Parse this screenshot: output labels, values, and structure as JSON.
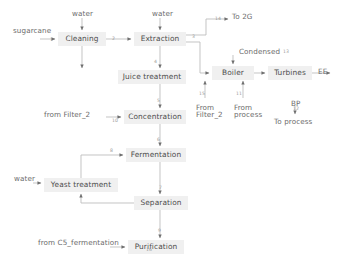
{
  "diagram": {
    "colors": {
      "node_fill": "#f0f0f0",
      "node_text": "#4d4d4d",
      "line": "#b9b9b9",
      "arrow": "#6e6e6e",
      "edge_label": "#9a9a9a",
      "plain_text": "#6b6b6b"
    },
    "nodes": [
      {
        "id": "cleaning",
        "label": "Cleaning",
        "x": 58,
        "y": 32,
        "w": 48,
        "h": 14
      },
      {
        "id": "extraction",
        "label": "Extraction",
        "x": 134,
        "y": 32,
        "w": 52,
        "h": 14
      },
      {
        "id": "juice_treatment",
        "label": "Juice treatment",
        "x": 118,
        "y": 70,
        "w": 68,
        "h": 14
      },
      {
        "id": "concentration",
        "label": "Concentration",
        "x": 124,
        "y": 110,
        "w": 62,
        "h": 14
      },
      {
        "id": "fermentation",
        "label": "Fermentation",
        "x": 126,
        "y": 148,
        "w": 60,
        "h": 14
      },
      {
        "id": "yeast_treatment",
        "label": "Yeast treatment",
        "x": 44,
        "y": 178,
        "w": 74,
        "h": 14
      },
      {
        "id": "separation",
        "label": "Separation",
        "x": 134,
        "y": 196,
        "w": 54,
        "h": 14
      },
      {
        "id": "purification",
        "label": "Purification",
        "x": 128,
        "y": 240,
        "w": 56,
        "h": 14
      },
      {
        "id": "boiler",
        "label": "Boiler",
        "x": 212,
        "y": 66,
        "w": 42,
        "h": 14
      },
      {
        "id": "turbines",
        "label": "Turbines",
        "x": 268,
        "y": 66,
        "w": 44,
        "h": 14
      }
    ],
    "terminals": [
      {
        "id": "sugarcane",
        "label": "sugarcane",
        "x": 13,
        "y": 27
      },
      {
        "id": "water_cleaning",
        "label": "water",
        "x": 72,
        "y": 10
      },
      {
        "id": "water_extraction",
        "label": "water",
        "x": 152,
        "y": 10
      },
      {
        "id": "to_2g",
        "label": "To 2G",
        "x": 232,
        "y": 13
      },
      {
        "id": "condensed",
        "label": "Condensed",
        "x": 239,
        "y": 48
      },
      {
        "id": "ee",
        "label": "EE",
        "x": 318,
        "y": 68
      },
      {
        "id": "bp",
        "label": "BP",
        "x": 291,
        "y": 100
      },
      {
        "id": "to_process",
        "label": "To process",
        "x": 274,
        "y": 118
      },
      {
        "id": "from_filter2_boiler",
        "label": "From\nFilter_2",
        "x": 196,
        "y": 104
      },
      {
        "id": "from_process",
        "label": "From\nprocess",
        "x": 234,
        "y": 104
      },
      {
        "id": "from_filter2_conc",
        "label": "from Filter_2",
        "x": 44,
        "y": 111
      },
      {
        "id": "water_yeast",
        "label": "water",
        "x": 14,
        "y": 175
      },
      {
        "id": "from_c5",
        "label": "from C5_fermentation",
        "x": 38,
        "y": 239
      }
    ],
    "edge_labels": [
      {
        "id": "e1",
        "text": "1",
        "x": 50,
        "y": 38
      },
      {
        "id": "e2",
        "text": "2",
        "x": 112,
        "y": 37
      },
      {
        "id": "e3",
        "text": "3",
        "x": 192,
        "y": 35
      },
      {
        "id": "e4",
        "text": "4",
        "x": 154,
        "y": 60
      },
      {
        "id": "e5",
        "text": "5",
        "x": 157,
        "y": 99
      },
      {
        "id": "e6",
        "text": "6",
        "x": 157,
        "y": 138
      },
      {
        "id": "e7",
        "text": "7",
        "x": 159,
        "y": 186
      },
      {
        "id": "e8",
        "text": "8",
        "x": 110,
        "y": 154
      },
      {
        "id": "e9",
        "text": "9",
        "x": 158,
        "y": 229
      },
      {
        "id": "e10",
        "text": "10",
        "x": 121,
        "y": 117
      },
      {
        "id": "e11",
        "text": "11",
        "x": 234,
        "y": 110
      },
      {
        "id": "e12",
        "text": "12",
        "x": 292,
        "y": 107
      },
      {
        "id": "e13",
        "text": "13",
        "x": 283,
        "y": 49
      },
      {
        "id": "e14",
        "text": "14",
        "x": 216,
        "y": 18
      },
      {
        "id": "e15",
        "text": "15",
        "x": 196,
        "y": 110
      },
      {
        "id": "e16",
        "text": "16",
        "x": 146,
        "y": 247
      }
    ]
  }
}
